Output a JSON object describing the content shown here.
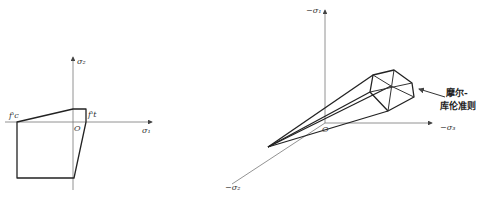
{
  "left_diagram": {
    "axis_labels": {
      "sigma2": "σ₂",
      "sigma1": "σ₁",
      "origin": "O"
    },
    "point_labels": {
      "fc": "f'c",
      "ft": "f't"
    }
  },
  "right_diagram": {
    "axis_labels": {
      "neg_sigma1": "−σ₁",
      "neg_sigma2": "−σ₂",
      "neg_sigma3": "−σ₃",
      "origin": "O"
    },
    "annotation": {
      "line1": "摩尔-",
      "line2": "库伦准则"
    }
  }
}
